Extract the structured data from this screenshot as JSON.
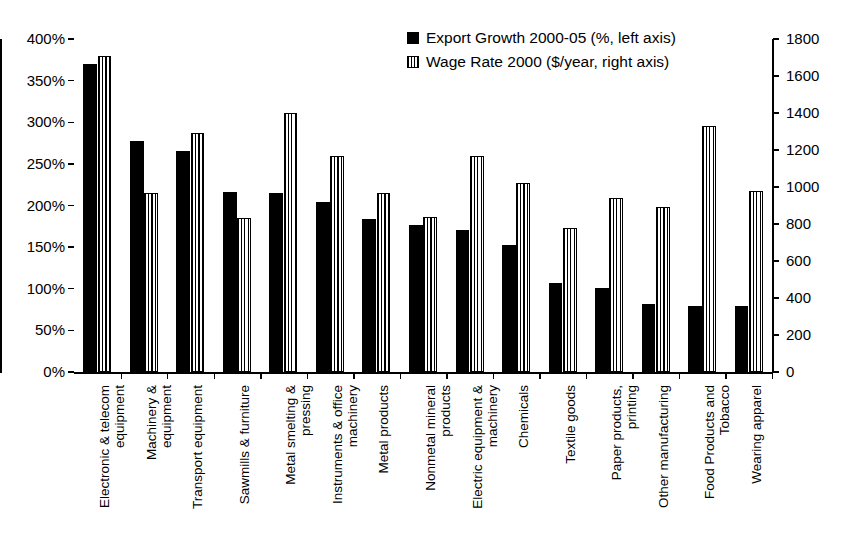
{
  "chart_data": {
    "type": "bar",
    "title": "",
    "subtitle": "",
    "xlabel": "",
    "ylabel": "",
    "grid": false,
    "legend_position": "top-center",
    "categories": [
      "Electronic & telecom\nequipment",
      "Machinery &\nequipment",
      "Transport equipment",
      "Sawmills & furniture",
      "Metal smelting &\npressing",
      "Instruments & office\nmachinery",
      "Metal products",
      "Nonmetal mineral\nproducts",
      "Electric equipment &\nmachinery",
      "Chemicals",
      "Textile goods",
      "Paper products,\nprinting",
      "Other manufacturing",
      "Food Products and\nTobacco",
      "Wearing apparel"
    ],
    "series": [
      {
        "name": "Export Growth 2000-05 (%, left axis)",
        "axis": "left",
        "units": "%",
        "style": "solid-black",
        "values": [
          370,
          278,
          265,
          216,
          215,
          204,
          184,
          177,
          171,
          152,
          107,
          101,
          82,
          79,
          79
        ]
      },
      {
        "name": "Wage Rate 2000 ($/year, right axis)",
        "axis": "right",
        "units": "$/year",
        "style": "vertical-hatch",
        "values": [
          1710,
          965,
          1290,
          830,
          1400,
          1165,
          965,
          840,
          1165,
          1020,
          780,
          940,
          890,
          1330,
          980
        ]
      }
    ],
    "left_axis": {
      "min": 0,
      "max": 400,
      "step": 50,
      "ticks": [
        "0%",
        "50%",
        "100%",
        "150%",
        "200%",
        "250%",
        "300%",
        "350%",
        "400%"
      ]
    },
    "right_axis": {
      "min": 0,
      "max": 1800,
      "step": 200,
      "ticks": [
        "0",
        "200",
        "400",
        "600",
        "800",
        "1000",
        "1200",
        "1400",
        "1600",
        "1800"
      ]
    }
  },
  "legend": {
    "items": [
      {
        "label": "Export Growth 2000-05 (%, left axis)",
        "swatch": "solid-black-square"
      },
      {
        "label": "Wage Rate 2000 ($/year, right axis)",
        "swatch": "hatched-square"
      }
    ]
  },
  "colors": {
    "series_1": "#000000",
    "series_2": "#ffffff",
    "axis": "#000000",
    "background": "#ffffff"
  }
}
